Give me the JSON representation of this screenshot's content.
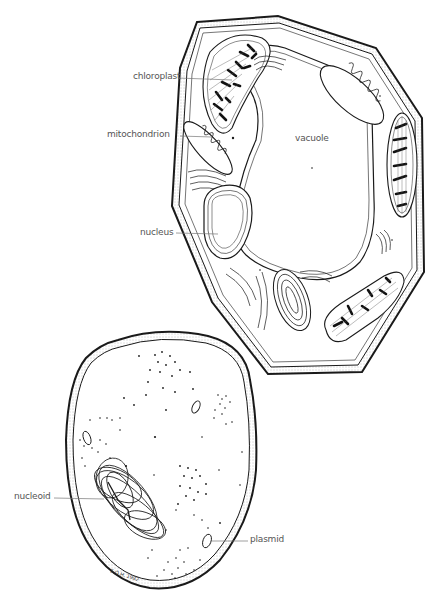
{
  "figure": {
    "type": "cell comparison illustration",
    "panels": [
      {
        "name": "plant-cell",
        "position": "upper-right"
      },
      {
        "name": "bacterial-cell",
        "position": "lower-left"
      }
    ]
  },
  "labels": {
    "chloroplast": "chloroplast",
    "mitochondrion": "mitochondrion",
    "vacuole": "vacuole",
    "nucleus": "nucleus",
    "nucleoid": "nucleoid",
    "plasmid": "plasmid"
  },
  "signature": "E.O.H. 1982",
  "colors": {
    "ink": "#1a1a1a",
    "label_text": "#555555",
    "leader_line": "#777777",
    "background": "#ffffff",
    "wall_stipple": "#bbbbbb"
  }
}
